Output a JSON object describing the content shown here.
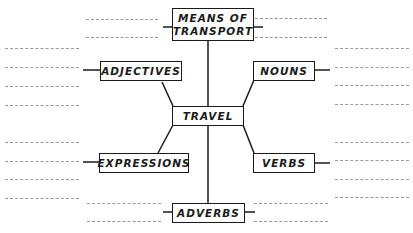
{
  "diagram": {
    "type": "word-map",
    "center": {
      "label": "TRAVEL"
    },
    "nodes": [
      {
        "id": "means",
        "label": "MEANS OF TRANSPORT",
        "line1": "MEANS OF",
        "line2": "TRANSPORT"
      },
      {
        "id": "adjectives",
        "label": "ADJECTIVES"
      },
      {
        "id": "nouns",
        "label": "NOUNS"
      },
      {
        "id": "expressions",
        "label": "EXPRESSIONS"
      },
      {
        "id": "verbs",
        "label": "VERBS"
      },
      {
        "id": "adverbs",
        "label": "ADVERBS"
      }
    ],
    "blank_lines_per_node": {
      "means": 4,
      "adjectives": 4,
      "nouns": 4,
      "expressions": 4,
      "verbs": 4,
      "adverbs": 4
    },
    "colors": {
      "ink": "#1a1a1a",
      "blank_line": "#9a9a9a",
      "background": "#ffffff"
    }
  }
}
